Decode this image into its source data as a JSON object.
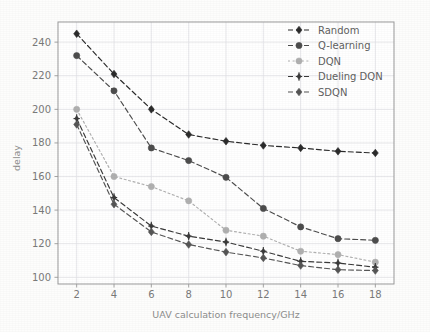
{
  "chart_data": {
    "type": "line",
    "title": "",
    "xlabel": "UAV calculation frequency/GHz",
    "ylabel": "delay",
    "x": [
      2,
      4,
      6,
      8,
      10,
      12,
      14,
      16,
      18
    ],
    "xticklabels": [
      "2",
      "4",
      "6",
      "8",
      "10",
      "12",
      "14",
      "16",
      "18"
    ],
    "yticklabels": [
      "100",
      "120",
      "140",
      "160",
      "180",
      "200",
      "220",
      "240"
    ],
    "yticks": [
      100,
      120,
      140,
      160,
      180,
      200,
      220,
      240
    ],
    "xlim": [
      1,
      19
    ],
    "ylim": [
      96,
      252
    ],
    "grid": true,
    "legend_position": "upper right",
    "series": [
      {
        "name": "Random",
        "values": [
          245,
          221,
          200,
          185,
          181,
          178.5,
          177,
          175,
          174
        ],
        "color": "#2b2b2b",
        "marker": "diamond",
        "linestyle": "dashed"
      },
      {
        "name": "Q-learning",
        "values": [
          232,
          211,
          177,
          169.5,
          159.5,
          141,
          130,
          123,
          122
        ],
        "color": "#4d4d4d",
        "marker": "circle",
        "linestyle": "dashed"
      },
      {
        "name": "DQN",
        "values": [
          200,
          160,
          154,
          145.5,
          128,
          124.5,
          115.5,
          113.5,
          109
        ],
        "color": "#b0b0b0",
        "marker": "circle",
        "linestyle": "dotted"
      },
      {
        "name": "Dueling DQN",
        "values": [
          194.5,
          147.5,
          130.5,
          124.5,
          121,
          115.5,
          109.5,
          108.5,
          106
        ],
        "color": "#3a3a3a",
        "marker": "plus-diamond",
        "linestyle": "dashed"
      },
      {
        "name": "SDQN",
        "values": [
          191,
          143.5,
          127,
          119.5,
          115,
          111.5,
          107,
          104.5,
          104
        ],
        "color": "#555555",
        "marker": "diamond",
        "linestyle": "dashed"
      }
    ]
  },
  "legend": {
    "entries": [
      {
        "label": "Random"
      },
      {
        "label": "Q-learning"
      },
      {
        "label": "DQN"
      },
      {
        "label": "Dueling DQN"
      },
      {
        "label": "SDQN"
      }
    ]
  },
  "axes": {
    "x_label": "UAV calculation frequency/GHz",
    "y_label": "delay"
  }
}
